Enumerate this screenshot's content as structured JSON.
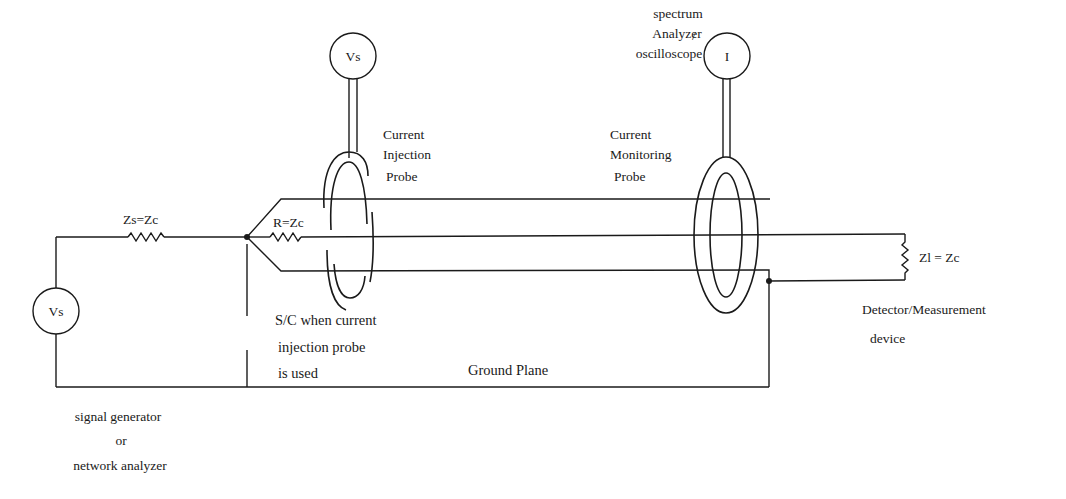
{
  "diagram": {
    "type": "circuit-schematic",
    "components": {
      "source": {
        "symbol": "Vs",
        "caption": [
          "signal generator",
          "or",
          "network analyzer"
        ]
      },
      "source_impedance": {
        "label": "Zs=Zc"
      },
      "termination_resistor": {
        "label": "R=Zc"
      },
      "injection_probe": {
        "caption": [
          "Current",
          "Injection",
          "Probe"
        ],
        "driver_symbol": "Vs"
      },
      "monitoring_probe": {
        "caption": [
          "Current",
          "Monitoring",
          "Probe"
        ],
        "meter_symbol": "I",
        "meter_caption": [
          "spectrum",
          "Analyzer",
          "oscilloscope"
        ],
        "separator": "/"
      },
      "load": {
        "label": "Zl = Zc",
        "caption": [
          "Detector/Measurement",
          "device"
        ]
      },
      "short_circuit_note": [
        "S/C when current",
        "injection probe",
        "is used"
      ],
      "ground": {
        "label": "Ground Plane"
      }
    }
  }
}
